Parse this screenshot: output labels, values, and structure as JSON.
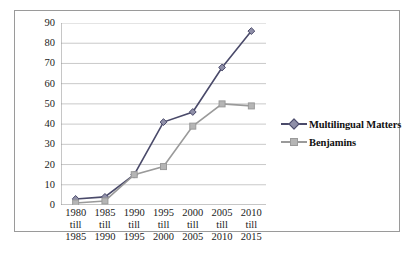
{
  "chart_data": {
    "type": "line",
    "title": "",
    "xlabel": "",
    "ylabel": "",
    "categories": [
      "1980 till 1985",
      "1985 till 1990",
      "1990 till 1995",
      "1995 till 2000",
      "2000 till 2005",
      "2005 till 2010",
      "2010 till 2015"
    ],
    "category_lines": [
      [
        "1980",
        "till",
        "1985"
      ],
      [
        "1985",
        "till",
        "1990"
      ],
      [
        "1990",
        "till",
        "1995"
      ],
      [
        "1995",
        "till",
        "2000"
      ],
      [
        "2000",
        "till",
        "2005"
      ],
      [
        "2005",
        "till",
        "2010"
      ],
      [
        "2010",
        "till",
        "2015"
      ]
    ],
    "series": [
      {
        "name": "Multilingual Matters",
        "color": "#4a4a6a",
        "marker": "diamond",
        "values": [
          3,
          4,
          15,
          41,
          46,
          68,
          86
        ]
      },
      {
        "name": "Benjamins",
        "color": "#9a9a9a",
        "marker": "square",
        "values": [
          1,
          2,
          15,
          19,
          39,
          50,
          49
        ]
      }
    ],
    "ylim": [
      0,
      90
    ],
    "yticks": [
      0,
      10,
      20,
      30,
      40,
      50,
      60,
      70,
      80,
      90
    ],
    "ytick_labels": [
      "0",
      "10",
      "20",
      "30",
      "40",
      "50",
      "60",
      "70",
      "80",
      "90"
    ],
    "grid": true,
    "legend_position": "right"
  },
  "frame": {
    "border_color": "#9a9a9a",
    "background": "#ffffff"
  }
}
